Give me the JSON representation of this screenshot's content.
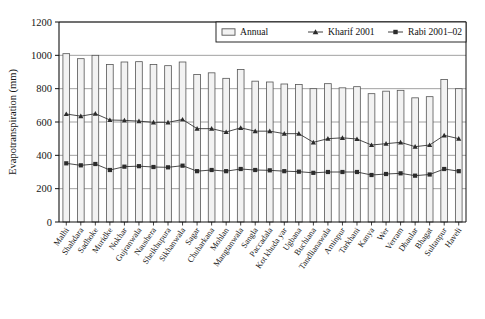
{
  "chart_data": {
    "type": "bar",
    "title": "",
    "subtitle": "",
    "xlabel": "",
    "ylabel": "Evapotranspiration (mm)",
    "ylim": [
      0,
      1200
    ],
    "yticks": [
      0,
      200,
      400,
      600,
      800,
      1000,
      1200
    ],
    "ytick_labels": [
      "0",
      "200",
      "400",
      "600",
      "800",
      "1000",
      "1200"
    ],
    "grid": true,
    "grid_axis": "y",
    "legend_position": "top-right-inside",
    "legend": [
      "Annual",
      "Kharif 2001",
      "Rabi 2001–02"
    ],
    "categories": [
      "Malhi",
      "Shahdara",
      "Sadhoke",
      "Muridke",
      "Nokhar",
      "Gujranwala",
      "Naushera",
      "Sheikhupura",
      "Sikhanwala",
      "Sagar",
      "Chuharkana",
      "Mohlan",
      "Mangtanwala",
      "Sangla",
      "Paccadala",
      "Kot khuda yar",
      "Ugbana",
      "Buchiana",
      "Tandlianawala",
      "Aminpur",
      "Tarkhani",
      "Kanya",
      "Wer",
      "Verram",
      "Dhaular",
      "Bhagat",
      "Sultanpur",
      "Haveli"
    ],
    "series": [
      {
        "name": "Annual",
        "render": "bar",
        "color": "#f2f2f2",
        "edge_color": "#555555",
        "values": [
          1010,
          980,
          1000,
          945,
          960,
          962,
          945,
          938,
          960,
          885,
          895,
          862,
          915,
          845,
          840,
          828,
          825,
          800,
          830,
          805,
          812,
          770,
          785,
          790,
          745,
          752,
          855,
          800
        ]
      },
      {
        "name": "Kharif 2001",
        "render": "line",
        "marker": "triangle",
        "color": "#2b2b2b",
        "values": [
          648,
          635,
          650,
          612,
          610,
          605,
          598,
          598,
          615,
          560,
          560,
          540,
          565,
          545,
          545,
          530,
          530,
          478,
          500,
          505,
          498,
          462,
          470,
          478,
          452,
          462,
          520,
          500
        ]
      },
      {
        "name": "Rabi 2001–02",
        "render": "line",
        "marker": "square",
        "color": "#2b2b2b",
        "values": [
          352,
          340,
          348,
          312,
          332,
          335,
          330,
          328,
          338,
          305,
          312,
          305,
          318,
          312,
          310,
          305,
          302,
          295,
          300,
          300,
          300,
          282,
          288,
          292,
          278,
          285,
          318,
          305
        ]
      }
    ]
  },
  "axes": {
    "plot_left": 59,
    "plot_right": 466,
    "plot_top": 22,
    "plot_bottom": 222
  },
  "legend_box": {
    "x": 216,
    "y": 22,
    "width": 250,
    "height": 20
  }
}
